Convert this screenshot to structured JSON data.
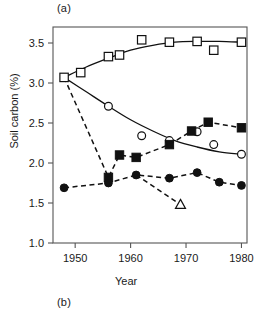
{
  "figure": {
    "panel_a_label": "(a)",
    "panel_b_label": "(b)",
    "ylabel": "Soil carbon (%)",
    "xlabel": "Year"
  },
  "chart_data": {
    "type": "scatter",
    "title": "",
    "xlabel": "Year",
    "ylabel": "Soil carbon (%)",
    "xlim": [
      1946,
      1981
    ],
    "ylim": [
      1.0,
      3.7
    ],
    "xticks": [
      1950,
      1960,
      1970,
      1980
    ],
    "xticklabels": [
      "1950",
      "1960",
      "1970",
      "1980"
    ],
    "yticks": [
      1.0,
      1.5,
      2.0,
      2.5,
      3.0,
      3.5
    ],
    "yticklabels": [
      "1.0",
      "1.5",
      "2.0",
      "2.5",
      "3.0",
      "3.5"
    ],
    "grid": false,
    "legend": "none",
    "series": [
      {
        "name": "open-squares",
        "marker": "open-square",
        "line": "solid",
        "points": [
          {
            "x": 1948,
            "y": 3.07
          },
          {
            "x": 1951,
            "y": 3.13
          },
          {
            "x": 1956,
            "y": 3.33
          },
          {
            "x": 1958,
            "y": 3.35
          },
          {
            "x": 1962,
            "y": 3.54
          },
          {
            "x": 1967,
            "y": 3.51
          },
          {
            "x": 1972,
            "y": 3.52
          },
          {
            "x": 1975,
            "y": 3.41
          },
          {
            "x": 1980,
            "y": 3.51
          }
        ],
        "fit_curve": [
          {
            "x": 1948,
            "y": 3.07
          },
          {
            "x": 1952,
            "y": 3.2
          },
          {
            "x": 1956,
            "y": 3.31
          },
          {
            "x": 1960,
            "y": 3.41
          },
          {
            "x": 1964,
            "y": 3.47
          },
          {
            "x": 1968,
            "y": 3.51
          },
          {
            "x": 1972,
            "y": 3.52
          },
          {
            "x": 1976,
            "y": 3.52
          },
          {
            "x": 1980,
            "y": 3.51
          }
        ]
      },
      {
        "name": "open-circles",
        "marker": "open-circle",
        "line": "solid",
        "points": [
          {
            "x": 1956,
            "y": 2.71
          },
          {
            "x": 1962,
            "y": 2.34
          },
          {
            "x": 1967,
            "y": 2.28
          },
          {
            "x": 1972,
            "y": 2.39
          },
          {
            "x": 1975,
            "y": 2.23
          },
          {
            "x": 1980,
            "y": 2.11
          }
        ],
        "fit_curve": [
          {
            "x": 1948,
            "y": 3.07
          },
          {
            "x": 1952,
            "y": 2.89
          },
          {
            "x": 1956,
            "y": 2.71
          },
          {
            "x": 1960,
            "y": 2.54
          },
          {
            "x": 1964,
            "y": 2.4
          },
          {
            "x": 1968,
            "y": 2.28
          },
          {
            "x": 1972,
            "y": 2.2
          },
          {
            "x": 1976,
            "y": 2.14
          },
          {
            "x": 1980,
            "y": 2.11
          }
        ]
      },
      {
        "name": "filled-squares",
        "marker": "filled-square",
        "line": "dashed",
        "points": [
          {
            "x": 1956,
            "y": 1.82
          },
          {
            "x": 1958,
            "y": 2.1
          },
          {
            "x": 1961,
            "y": 2.07
          },
          {
            "x": 1967,
            "y": 2.23
          },
          {
            "x": 1971,
            "y": 2.4
          },
          {
            "x": 1974,
            "y": 2.51
          },
          {
            "x": 1980,
            "y": 2.44
          }
        ],
        "trend": [
          {
            "x": 1948,
            "y": 3.07
          },
          {
            "x": 1956,
            "y": 1.82
          },
          {
            "x": 1958,
            "y": 2.1
          },
          {
            "x": 1961,
            "y": 2.07
          },
          {
            "x": 1967,
            "y": 2.23
          },
          {
            "x": 1971,
            "y": 2.4
          },
          {
            "x": 1974,
            "y": 2.51
          },
          {
            "x": 1980,
            "y": 2.44
          }
        ]
      },
      {
        "name": "filled-circles",
        "marker": "filled-circle",
        "line": "dashed",
        "points": [
          {
            "x": 1948,
            "y": 1.69
          },
          {
            "x": 1956,
            "y": 1.75
          },
          {
            "x": 1961,
            "y": 1.85
          },
          {
            "x": 1967,
            "y": 1.81
          },
          {
            "x": 1972,
            "y": 1.88
          },
          {
            "x": 1976,
            "y": 1.76
          },
          {
            "x": 1980,
            "y": 1.72
          }
        ]
      },
      {
        "name": "open-triangle",
        "marker": "open-triangle",
        "line": "dashed",
        "points": [
          {
            "x": 1969,
            "y": 1.48
          }
        ],
        "trend": [
          {
            "x": 1961,
            "y": 1.85
          },
          {
            "x": 1969,
            "y": 1.48
          }
        ]
      }
    ]
  }
}
